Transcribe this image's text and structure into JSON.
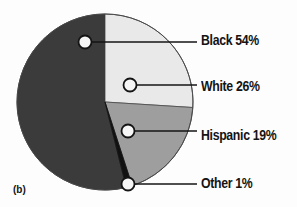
{
  "figure": {
    "caption": "(b)",
    "background_color": "#fdfdfd"
  },
  "chart_data": {
    "type": "pie",
    "title": "",
    "xlabel": "",
    "ylabel": "",
    "legend_position": "right-callouts",
    "grid": false,
    "start_angle_deg": 0,
    "direction": "clockwise",
    "center": {
      "x": 105,
      "y": 102,
      "radius": 88
    },
    "categories": [
      "White",
      "Hispanic",
      "Other",
      "Black"
    ],
    "values": [
      26,
      19,
      1,
      54
    ],
    "labels": [
      "White 26%",
      "Hispanic 19%",
      "Other 1%",
      "Black 54%"
    ],
    "colors": [
      "#e9e9e9",
      "#9e9e9e",
      "#111111",
      "#3b3b3b"
    ],
    "slices": [
      {
        "name": "black",
        "label": "Black 54%",
        "category": "Black",
        "value": 54,
        "value_text": "54%",
        "color": "#3b3b3b",
        "start_deg": 166,
        "end_deg": 360,
        "marker": {
          "x": 85,
          "y": 42
        },
        "leader_end": {
          "x": 197,
          "y": 42
        },
        "label_pos": {
          "x": 201,
          "y": 32
        }
      },
      {
        "name": "white",
        "label": "White 26%",
        "category": "White",
        "value": 26,
        "value_text": "26%",
        "color": "#e9e9e9",
        "start_deg": 0,
        "end_deg": 93.6,
        "marker": {
          "x": 130,
          "y": 85
        },
        "leader_end": {
          "x": 197,
          "y": 85
        },
        "label_pos": {
          "x": 201,
          "y": 78
        }
      },
      {
        "name": "hispanic",
        "label": "Hispanic 19%",
        "category": "Hispanic",
        "value": 19,
        "value_text": "19%",
        "color": "#9e9e9e",
        "start_deg": 93.6,
        "end_deg": 162,
        "marker": {
          "x": 128,
          "y": 131
        },
        "leader_end": {
          "x": 197,
          "y": 131
        },
        "label_pos": {
          "x": 201,
          "y": 127
        }
      },
      {
        "name": "other",
        "label": "Other 1%",
        "category": "Other",
        "value": 1,
        "value_text": "1%",
        "color": "#111111",
        "start_deg": 162,
        "end_deg": 166,
        "marker": {
          "x": 128,
          "y": 184
        },
        "leader_end": {
          "x": 197,
          "y": 184
        },
        "label_pos": {
          "x": 201,
          "y": 175
        }
      }
    ]
  }
}
